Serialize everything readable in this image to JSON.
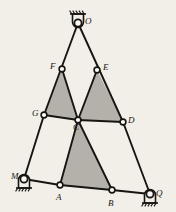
{
  "figure": {
    "kind": "truss-diagram",
    "background_color": "#f2efe9",
    "member_color": "#17150f",
    "shade_color": "#b3b1aa",
    "node_fill": "#fbfaf6",
    "nodes": [
      {
        "id": "O",
        "label": "O",
        "x": 78,
        "y": 23,
        "type": "support-pin-top",
        "label_dx": 7,
        "label_dy": -6
      },
      {
        "id": "F",
        "label": "F",
        "x": 62,
        "y": 69,
        "type": "joint",
        "label_dx": -12,
        "label_dy": -7
      },
      {
        "id": "E",
        "label": "E",
        "x": 97,
        "y": 70,
        "type": "joint",
        "label_dx": 6,
        "label_dy": -7
      },
      {
        "id": "G",
        "label": "G",
        "x": 44,
        "y": 115,
        "type": "joint",
        "label_dx": -12,
        "label_dy": -6
      },
      {
        "id": "C",
        "label": "C",
        "x": 78,
        "y": 120,
        "type": "joint",
        "label_dx": -5,
        "label_dy": 3
      },
      {
        "id": "D",
        "label": "D",
        "x": 123,
        "y": 122,
        "type": "joint",
        "label_dx": 5,
        "label_dy": -6
      },
      {
        "id": "M",
        "label": "M",
        "x": 24,
        "y": 179,
        "type": "support-pin-bottom",
        "label_dx": -13,
        "label_dy": -7
      },
      {
        "id": "A",
        "label": "A",
        "x": 60,
        "y": 185,
        "type": "joint",
        "label_dx": -4,
        "label_dy": 8
      },
      {
        "id": "B",
        "label": "B",
        "x": 112,
        "y": 190,
        "type": "joint",
        "label_dx": -4,
        "label_dy": 9
      },
      {
        "id": "Q",
        "label": "Q",
        "x": 150,
        "y": 194,
        "type": "support-pin-bottom",
        "label_dx": 6,
        "label_dy": -5
      }
    ],
    "members": [
      {
        "name": "O-G",
        "from": "O",
        "to": "G"
      },
      {
        "name": "O-D",
        "from": "O",
        "to": "D"
      },
      {
        "name": "G-M",
        "from": "G",
        "to": "M"
      },
      {
        "name": "D-Q",
        "from": "D",
        "to": "Q"
      },
      {
        "name": "G-C",
        "from": "G",
        "to": "C"
      },
      {
        "name": "C-D",
        "from": "C",
        "to": "D"
      },
      {
        "name": "M-A",
        "from": "M",
        "to": "A"
      },
      {
        "name": "A-B",
        "from": "A",
        "to": "B"
      },
      {
        "name": "B-Q",
        "from": "B",
        "to": "Q"
      },
      {
        "name": "F-C",
        "from": "F",
        "to": "C"
      },
      {
        "name": "E-C",
        "from": "E",
        "to": "C"
      },
      {
        "name": "C-A",
        "from": "C",
        "to": "A"
      },
      {
        "name": "C-B",
        "from": "C",
        "to": "B"
      }
    ],
    "shaded_triangles": [
      {
        "name": "triangle-FGC",
        "vertices": [
          "F",
          "G",
          "C"
        ]
      },
      {
        "name": "triangle-ECD",
        "vertices": [
          "E",
          "C",
          "D"
        ]
      },
      {
        "name": "triangle-CAB",
        "vertices": [
          "C",
          "A",
          "B"
        ]
      }
    ],
    "supports": [
      {
        "name": "support-O",
        "node": "O",
        "orientation": "top",
        "hatch_side": "above"
      },
      {
        "name": "support-M",
        "node": "M",
        "orientation": "bottom",
        "hatch_side": "below"
      },
      {
        "name": "support-Q",
        "node": "Q",
        "orientation": "bottom",
        "hatch_side": "below"
      }
    ]
  }
}
